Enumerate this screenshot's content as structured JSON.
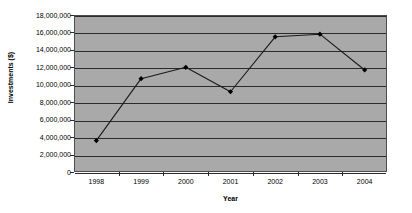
{
  "chart_data": {
    "type": "line",
    "title": "1998-2004",
    "xlabel": "Year",
    "ylabel": "Investments ($)",
    "categories": [
      "1998",
      "1999",
      "2000",
      "2001",
      "2002",
      "2003",
      "2004"
    ],
    "values": [
      3600000,
      10700000,
      12000000,
      9200000,
      15500000,
      15800000,
      11700000
    ],
    "series": [
      {
        "name": "Investments",
        "values": [
          3600000,
          10700000,
          12000000,
          9200000,
          15500000,
          15800000,
          11700000
        ]
      }
    ],
    "ylim": [
      0,
      18000000
    ],
    "ytick_step": 2000000,
    "ytick_labels": [
      "18,000,000",
      "16,000,000",
      "14,000,000",
      "12,000,000",
      "10,000,000",
      "8,000,000",
      "6,000,000",
      "4,000,000",
      "2,000,000",
      "0"
    ],
    "ytick_values": [
      18000000,
      16000000,
      14000000,
      12000000,
      10000000,
      8000000,
      6000000,
      4000000,
      2000000,
      0
    ],
    "grid": true,
    "legend": false,
    "legend_position": "none",
    "marker": "filled-diamond",
    "colors": {
      "plot_background": "#a9a9a9",
      "gridline": "#2b2b2b",
      "line": "#1a1a1a",
      "marker": "#000000",
      "axis": "#4d4d4d",
      "text": "#000000",
      "page_background": "#ffffff"
    }
  }
}
